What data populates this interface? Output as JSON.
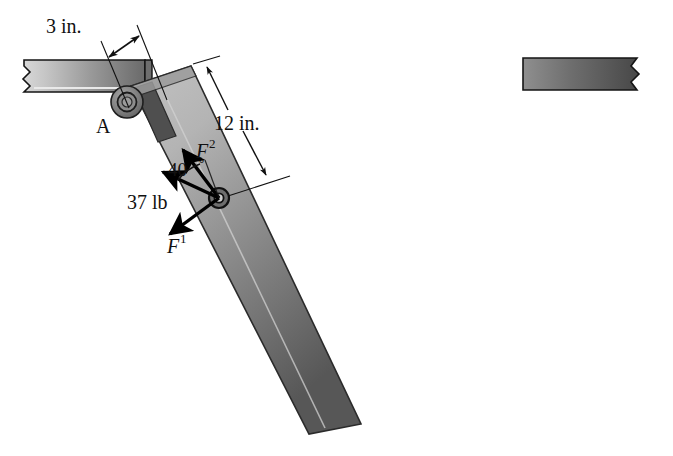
{
  "figure": {
    "background_color": "#ffffff",
    "width": 673,
    "height": 456
  },
  "labels": {
    "dimension_3in": "3 in.",
    "dimension_12in": "12 in.",
    "support_point": "A",
    "angle": "40",
    "angle_unit": "°",
    "load_magnitude": "37 lb",
    "force_1_base": "F",
    "force_1_sup": "1",
    "force_2_base": "F",
    "force_2_sup": "2"
  },
  "members": {
    "wall_bracket": {
      "name": "fixed horizontal bracket",
      "fill_left": "#cfcfcf",
      "fill_right": "#6e6e6e",
      "outline": "#1a1a1a"
    },
    "lever_arm": {
      "name": "inclined lever arm",
      "fill_top": "#b8b8b8",
      "fill_bottom": "#5a5a5a",
      "outline": "#2a2a2a"
    },
    "detached_bar": {
      "name": "detached dark bar",
      "fill_left": "#8a8a8a",
      "fill_right": "#4a4a4a",
      "outline": "#1a1a1a"
    }
  },
  "pins": {
    "pin_a": {
      "name": "pin support A",
      "cx": 127,
      "cy": 102,
      "r": 15,
      "fill": "#808080"
    },
    "pin_load": {
      "name": "load application pin",
      "cx": 219,
      "cy": 198,
      "r": 9,
      "fill": "#6b6b6b"
    }
  },
  "geometry": {
    "dim_3in_value": 3,
    "dim_3in_unit": "in.",
    "dim_12in_value": 12,
    "dim_12in_unit": "in.",
    "angle_value": 40,
    "angle_unit": "deg",
    "load_value": 37,
    "load_unit": "lb"
  },
  "colors": {
    "line": "#111111",
    "arrow": "#000000",
    "paper": "#ffffff"
  }
}
